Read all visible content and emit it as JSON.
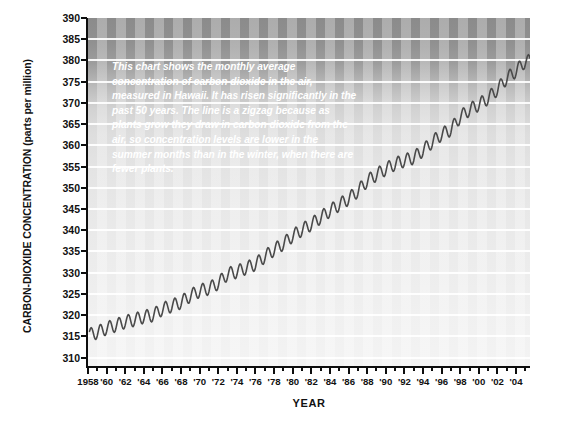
{
  "chart_data": {
    "type": "line",
    "title": "",
    "xlabel": "YEAR",
    "ylabel": "CARBON-DIOXIDE CONCENTRATION (parts per million)",
    "xlim": [
      1958,
      2005.5
    ],
    "ylim": [
      308,
      390
    ],
    "grid": true,
    "legend": "none",
    "annotation": "This chart shows the monthly average concentration of carbon dioxide in the air, measured in Hawaii. It has risen significantly in the past 50 years. The line is a zigzag because as plants grow they draw in carbon dioxide from the air, so concentration levels are lower in the summer months than in the winter, when there are fewer plants.",
    "y_ticks": [
      390,
      385,
      380,
      375,
      370,
      365,
      360,
      355,
      350,
      345,
      340,
      335,
      330,
      325,
      320,
      315,
      310
    ],
    "x_ticks": [
      1958,
      1960,
      1962,
      1964,
      1966,
      1968,
      1970,
      1972,
      1974,
      1976,
      1978,
      1980,
      1982,
      1984,
      1986,
      1988,
      1990,
      1992,
      1994,
      1996,
      1998,
      2000,
      2002,
      2004
    ],
    "x_tick_labels": [
      "1958",
      "'60",
      "'62",
      "'64",
      "'66",
      "'68",
      "'70",
      "'72",
      "'74",
      "'76",
      "'78",
      "'80",
      "'82",
      "'84",
      "'86",
      "'88",
      "'90",
      "'92",
      "'94",
      "'96",
      "'98",
      "'00",
      "'02",
      "'04"
    ],
    "series": [
      {
        "name": "Monthly mean CO2 (Mauna Loa, Hawaii)",
        "color": "#4a4a4a",
        "annual_means": [
          {
            "year": 1958,
            "value": 315.3
          },
          {
            "year": 1959,
            "value": 315.9
          },
          {
            "year": 1960,
            "value": 316.9
          },
          {
            "year": 1961,
            "value": 317.6
          },
          {
            "year": 1962,
            "value": 318.4
          },
          {
            "year": 1963,
            "value": 318.9
          },
          {
            "year": 1964,
            "value": 319.6
          },
          {
            "year": 1965,
            "value": 320.0
          },
          {
            "year": 1966,
            "value": 321.4
          },
          {
            "year": 1967,
            "value": 322.2
          },
          {
            "year": 1968,
            "value": 323.0
          },
          {
            "year": 1969,
            "value": 324.6
          },
          {
            "year": 1970,
            "value": 325.7
          },
          {
            "year": 1971,
            "value": 326.3
          },
          {
            "year": 1972,
            "value": 327.5
          },
          {
            "year": 1973,
            "value": 329.7
          },
          {
            "year": 1974,
            "value": 330.2
          },
          {
            "year": 1975,
            "value": 331.1
          },
          {
            "year": 1976,
            "value": 332.0
          },
          {
            "year": 1977,
            "value": 333.8
          },
          {
            "year": 1978,
            "value": 335.4
          },
          {
            "year": 1979,
            "value": 336.8
          },
          {
            "year": 1980,
            "value": 338.7
          },
          {
            "year": 1981,
            "value": 340.1
          },
          {
            "year": 1982,
            "value": 341.4
          },
          {
            "year": 1983,
            "value": 343.0
          },
          {
            "year": 1984,
            "value": 344.6
          },
          {
            "year": 1985,
            "value": 346.0
          },
          {
            "year": 1986,
            "value": 347.4
          },
          {
            "year": 1987,
            "value": 349.2
          },
          {
            "year": 1988,
            "value": 351.6
          },
          {
            "year": 1989,
            "value": 353.1
          },
          {
            "year": 1990,
            "value": 354.4
          },
          {
            "year": 1991,
            "value": 355.6
          },
          {
            "year": 1992,
            "value": 356.4
          },
          {
            "year": 1993,
            "value": 357.1
          },
          {
            "year": 1994,
            "value": 358.8
          },
          {
            "year": 1995,
            "value": 360.8
          },
          {
            "year": 1996,
            "value": 362.6
          },
          {
            "year": 1997,
            "value": 363.7
          },
          {
            "year": 1998,
            "value": 366.7
          },
          {
            "year": 1999,
            "value": 368.4
          },
          {
            "year": 2000,
            "value": 369.6
          },
          {
            "year": 2001,
            "value": 371.1
          },
          {
            "year": 2002,
            "value": 373.2
          },
          {
            "year": 2003,
            "value": 375.8
          },
          {
            "year": 2004,
            "value": 377.5
          },
          {
            "year": 2005,
            "value": 379.8
          }
        ],
        "seasonal_amplitude": 3.1,
        "seasonal_peak_month": 5,
        "description": "Monthly average CO2 concentration showing a rising trend with an annual sawtooth seasonal cycle."
      }
    ]
  },
  "plot": {
    "line_color": "#4a4a4a",
    "background_top": "#8b8b8b",
    "background_bottom": "#f3f3f3",
    "gridline_color": "#ffffff",
    "axis_color": "#0d0d0d",
    "annotation_color": "#ffffff"
  }
}
